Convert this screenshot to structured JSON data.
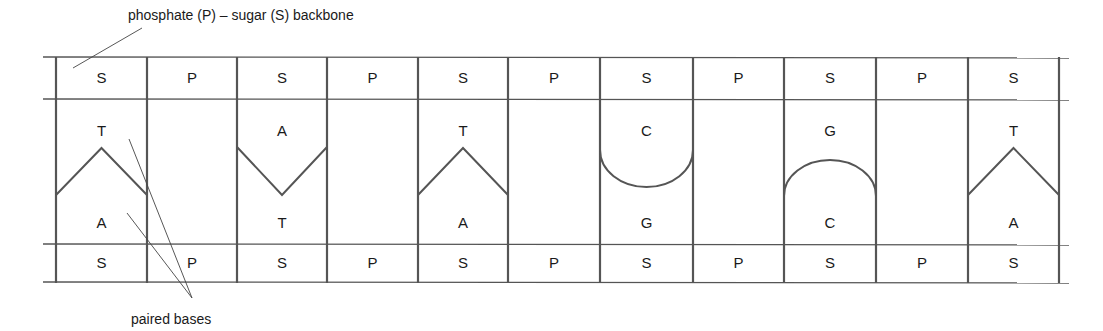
{
  "labels": {
    "backbone": "phosphate (P) – sugar (S) backbone",
    "paired_bases": "paired bases"
  },
  "colors": {
    "line": "#555555",
    "thin_line": "#444444",
    "text": "#1a1a1a"
  },
  "grid": {
    "x_start": 43,
    "x_end": 1069,
    "rows_y": [
      57,
      99,
      244,
      282
    ],
    "columns_x": [
      56,
      147,
      237,
      327,
      418,
      508,
      600,
      693,
      784,
      876,
      968,
      1059
    ]
  },
  "top_strand": [
    "S",
    "P",
    "S",
    "P",
    "S",
    "P",
    "S",
    "P",
    "S",
    "P",
    "S"
  ],
  "bottom_strand": [
    "S",
    "P",
    "S",
    "P",
    "S",
    "P",
    "S",
    "P",
    "S",
    "P",
    "S"
  ],
  "base_pairs": [
    {
      "column": 0,
      "top": "T",
      "bottom": "A",
      "shape": "peak"
    },
    {
      "column": 2,
      "top": "A",
      "bottom": "T",
      "shape": "valley"
    },
    {
      "column": 4,
      "top": "T",
      "bottom": "A",
      "shape": "peak"
    },
    {
      "column": 6,
      "top": "C",
      "bottom": "G",
      "shape": "cup"
    },
    {
      "column": 8,
      "top": "G",
      "bottom": "C",
      "shape": "arch"
    },
    {
      "column": 10,
      "top": "T",
      "bottom": "A",
      "shape": "peak"
    }
  ],
  "pointers": {
    "backbone": [
      [
        73,
        68
      ],
      [
        142,
        28
      ]
    ],
    "paired_bases": [
      [
        [
          129,
          139
        ],
        [
          192,
          298
        ]
      ],
      [
        [
          127,
          213
        ],
        [
          192,
          298
        ]
      ]
    ]
  }
}
